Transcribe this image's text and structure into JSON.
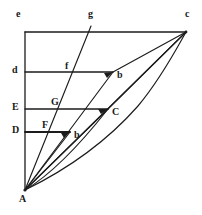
{
  "figure": {
    "kind": "geometry-diagram",
    "canvas": {
      "width": 202,
      "height": 215
    },
    "stroke_color": "#1c1c1c",
    "background_color": "#ffffff",
    "stroke_width": 1.1
  },
  "points": {
    "A": {
      "label": "A",
      "x": 25,
      "y": 190,
      "label_x": 20,
      "label_y": 194
    },
    "e": {
      "label": "e",
      "x": 25,
      "y": 32,
      "label_x": 16,
      "label_y": 9
    },
    "c": {
      "label": "c",
      "x": 186,
      "y": 32,
      "label_x": 186,
      "label_y": 9
    },
    "g": {
      "label": "g",
      "x": 90,
      "y": 32,
      "label_x": 88,
      "label_y": 9
    },
    "d": {
      "label": "d",
      "x": 25,
      "y": 72,
      "label_x": 13,
      "label_y": 65
    },
    "b_upper": {
      "label": "b",
      "x": 113,
      "y": 72,
      "label_x": 116,
      "label_y": 72
    },
    "f": {
      "label": "f",
      "x": 74,
      "y": 72,
      "label_x": 65,
      "label_y": 61
    },
    "E": {
      "label": "E",
      "x": 25,
      "y": 109,
      "label_x": 13,
      "label_y": 102
    },
    "C": {
      "label": "C",
      "x": 108,
      "y": 109,
      "label_x": 111,
      "label_y": 109
    },
    "G": {
      "label": "G",
      "x": 61,
      "y": 109,
      "label_x": 51,
      "label_y": 97
    },
    "D": {
      "label": "D",
      "x": 25,
      "y": 132,
      "label_x": 13,
      "label_y": 125
    },
    "b_lower": {
      "label": "b",
      "x": 70,
      "y": 132,
      "label_x": 73,
      "label_y": 132
    },
    "F": {
      "label": "F",
      "x": 47,
      "y": 132,
      "label_x": 42,
      "label_y": 120
    }
  },
  "labels": [
    {
      "name": "label-e",
      "text": "e",
      "x": 16,
      "y": 9
    },
    {
      "name": "label-g",
      "text": "g",
      "x": 88,
      "y": 9
    },
    {
      "name": "label-c",
      "text": "c",
      "x": 185,
      "y": 9
    },
    {
      "name": "label-d",
      "text": "d",
      "x": 12,
      "y": 65
    },
    {
      "name": "label-f",
      "text": "f",
      "x": 65,
      "y": 61
    },
    {
      "name": "label-b-upper",
      "text": "b",
      "x": 117,
      "y": 70
    },
    {
      "name": "label-E",
      "text": "E",
      "x": 12,
      "y": 102
    },
    {
      "name": "label-G",
      "text": "G",
      "x": 51,
      "y": 97
    },
    {
      "name": "label-C",
      "text": "C",
      "x": 112,
      "y": 107
    },
    {
      "name": "label-D",
      "text": "D",
      "x": 12,
      "y": 125
    },
    {
      "name": "label-F",
      "text": "F",
      "x": 42,
      "y": 120
    },
    {
      "name": "label-b-lower",
      "text": "b",
      "x": 74,
      "y": 130
    },
    {
      "name": "label-A",
      "text": "A",
      "x": 19,
      "y": 194
    }
  ],
  "segments": [
    {
      "name": "vertical-axis-e-A",
      "x1": 25,
      "y1": 32,
      "x2": 25,
      "y2": 190,
      "weight": 1.2
    },
    {
      "name": "horizontal-top-e-c",
      "x1": 25,
      "y1": 32,
      "x2": 186,
      "y2": 32,
      "weight": 1.2
    },
    {
      "name": "horizontal-d-b",
      "x1": 25,
      "y1": 72,
      "x2": 113,
      "y2": 72,
      "weight": 1.2
    },
    {
      "name": "horizontal-E-C",
      "x1": 25,
      "y1": 109,
      "x2": 108,
      "y2": 109,
      "weight": 1.2
    },
    {
      "name": "horizontal-D-b",
      "x1": 25,
      "y1": 132,
      "x2": 70,
      "y2": 132,
      "weight": 1.8
    },
    {
      "name": "ray-A-g",
      "x1": 25,
      "y1": 190,
      "x2": 90,
      "y2": 32,
      "weight": 1.1
    },
    {
      "name": "ray-A-c",
      "x1": 25,
      "y1": 190,
      "x2": 186,
      "y2": 32,
      "weight": 1.1
    },
    {
      "name": "ray-A-b-upper",
      "x1": 25,
      "y1": 190,
      "x2": 113,
      "y2": 72,
      "weight": 1.1
    },
    {
      "name": "ray-A-C",
      "x1": 25,
      "y1": 190,
      "x2": 108,
      "y2": 109,
      "weight": 1.1
    },
    {
      "name": "ray-A-b-lower",
      "x1": 25,
      "y1": 190,
      "x2": 70,
      "y2": 132,
      "weight": 1.1
    },
    {
      "name": "chord-b-upper-c",
      "x1": 113,
      "y1": 72,
      "x2": 186,
      "y2": 32,
      "weight": 1.1
    },
    {
      "name": "chord-C-c",
      "x1": 108,
      "y1": 109,
      "x2": 186,
      "y2": 32,
      "weight": 1.1
    }
  ],
  "curves": [
    {
      "name": "curve-A-b-upper-c",
      "d": "M 25 190 Q 96 150 140 100 Q 168 66 186 32",
      "weight": 1.1
    },
    {
      "name": "curve-A-C-c",
      "d": "M 25 190 Q 70 152 108 109",
      "weight": 1.1
    }
  ],
  "arrowheads": [
    {
      "name": "arrowhead-b-upper",
      "x": 113,
      "y": 72,
      "angle": -53
    },
    {
      "name": "arrowhead-C",
      "x": 108,
      "y": 109,
      "angle": -44
    },
    {
      "name": "arrowhead-b-lower",
      "x": 70,
      "y": 132,
      "angle": -52
    }
  ]
}
